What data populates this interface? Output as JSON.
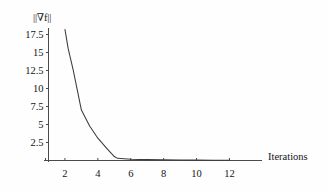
{
  "chart_data": {
    "type": "line",
    "title": "",
    "subtitle": "",
    "xlabel": "Iterations",
    "ylabel": "||∇f||",
    "x": [
      2,
      2.2,
      2.5,
      3,
      3.5,
      4,
      4.5,
      5,
      5.2,
      6,
      7,
      8,
      9,
      10,
      11,
      12
    ],
    "values": [
      18.2,
      15.5,
      12.6,
      7.0,
      4.8,
      3.1,
      1.8,
      0.55,
      0.3,
      0.18,
      0.12,
      0.09,
      0.07,
      0.05,
      0.04,
      0.03
    ],
    "series": [
      {
        "name": "||∇f||",
        "values": [
          18.2,
          15.5,
          12.6,
          7.0,
          4.8,
          3.1,
          1.8,
          0.55,
          0.3,
          0.18,
          0.12,
          0.09,
          0.07,
          0.05,
          0.04,
          0.03
        ]
      }
    ],
    "xlim": [
      1,
      12.6
    ],
    "ylim": [
      0,
      19
    ],
    "xticks": [
      2,
      4,
      6,
      8,
      10,
      12
    ],
    "xtick_labels": [
      "2",
      "4",
      "6",
      "8",
      "10",
      "12"
    ],
    "yticks": [
      2.5,
      5,
      7.5,
      10,
      12.5,
      15,
      17.5
    ],
    "ytick_labels": [
      "2.5",
      "5",
      "7.5",
      "10",
      "12.5",
      "15",
      "17.5"
    ],
    "grid": false,
    "legend": false,
    "legend_position": "none",
    "line_color": "#3c3c3c",
    "axis_color": "#4a4a4a",
    "background_color": "#fefefe",
    "annotations": []
  },
  "axes": {
    "y_title": "||∇f||",
    "x_title": "Iterations"
  }
}
